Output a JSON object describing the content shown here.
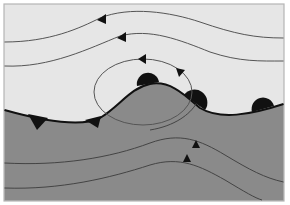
{
  "diagram": {
    "title": "",
    "type": "weather-front-streamline-diagram",
    "colors": {
      "background": "#ffffff",
      "cold_air": "#e6e6e6",
      "warm_air": "#8a8a8a",
      "border": "#b5b5b5",
      "front_line": "#111111",
      "streamline": "#555555",
      "symbol": "#111111"
    },
    "regions": [
      {
        "name": "upper-air-mass",
        "shade": "light"
      },
      {
        "name": "lower-air-mass",
        "shade": "dark"
      }
    ],
    "front": {
      "cold_front_triangles": 2,
      "warm_front_semicircles": 3
    },
    "streamlines": {
      "upper_count": 2,
      "lower_count": 2,
      "closed_loop_count": 1,
      "arrow_direction_upper": "left",
      "arrow_direction_lower": "up-right"
    }
  }
}
